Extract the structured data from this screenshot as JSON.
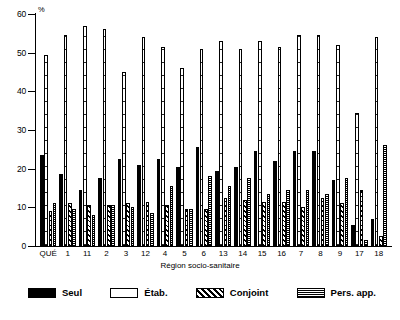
{
  "chart_data": {
    "type": "bar",
    "title": "",
    "subtitle": "",
    "xlabel": "Région socio-sanitaire",
    "ylabel": "%",
    "ylim": [
      0,
      60
    ],
    "yticks": [
      0,
      10,
      20,
      30,
      40,
      50,
      60
    ],
    "ytick_labels": [
      "0",
      "10",
      "20",
      "30",
      "40",
      "50",
      "60"
    ],
    "grid": false,
    "legend_position": "bottom",
    "categories": [
      "QUÉ",
      "1",
      "11",
      "2",
      "3",
      "12",
      "4",
      "5",
      "6",
      "13",
      "14",
      "15",
      "16",
      "7",
      "8",
      "9",
      "17",
      "18"
    ],
    "series": [
      {
        "name": "Seul",
        "pattern": "solid-black",
        "values": [
          23.5,
          18.5,
          14.5,
          17.5,
          22.5,
          21.0,
          22.5,
          20.5,
          25.5,
          19.5,
          20.5,
          24.5,
          22.0,
          24.5,
          24.5,
          17.0,
          5.5,
          7.0
        ]
      },
      {
        "name": "Étab.",
        "pattern": "open-white",
        "values": [
          49.5,
          54.5,
          57.0,
          56.0,
          45.0,
          54.0,
          51.5,
          46.0,
          51.0,
          53.0,
          51.0,
          53.0,
          51.5,
          54.5,
          54.5,
          52.0,
          34.5,
          54.0
        ]
      },
      {
        "name": "Conjoint",
        "pattern": "diagonal-hatch",
        "values": [
          9.0,
          11.0,
          10.5,
          10.5,
          11.0,
          11.5,
          10.5,
          9.5,
          9.5,
          12.5,
          12.0,
          11.5,
          11.5,
          10.0,
          12.5,
          11.0,
          14.5,
          2.5
        ]
      },
      {
        "name": "Pers. app.",
        "pattern": "dotted-checker",
        "values": [
          11.0,
          9.5,
          8.0,
          10.5,
          10.0,
          8.5,
          15.5,
          9.5,
          18.0,
          15.5,
          17.5,
          13.5,
          14.5,
          14.5,
          13.5,
          17.5,
          1.5,
          26.0
        ]
      }
    ]
  },
  "axis": {
    "y_unit_label": "%",
    "x_title": "Région socio-sanitaire"
  },
  "legend": {
    "items": [
      {
        "label": "Seul",
        "key": "seul"
      },
      {
        "label": "Étab.",
        "key": "etab"
      },
      {
        "label": "Conjoint",
        "key": "conjoint"
      },
      {
        "label": "Pers. app.",
        "key": "persapp"
      }
    ]
  }
}
